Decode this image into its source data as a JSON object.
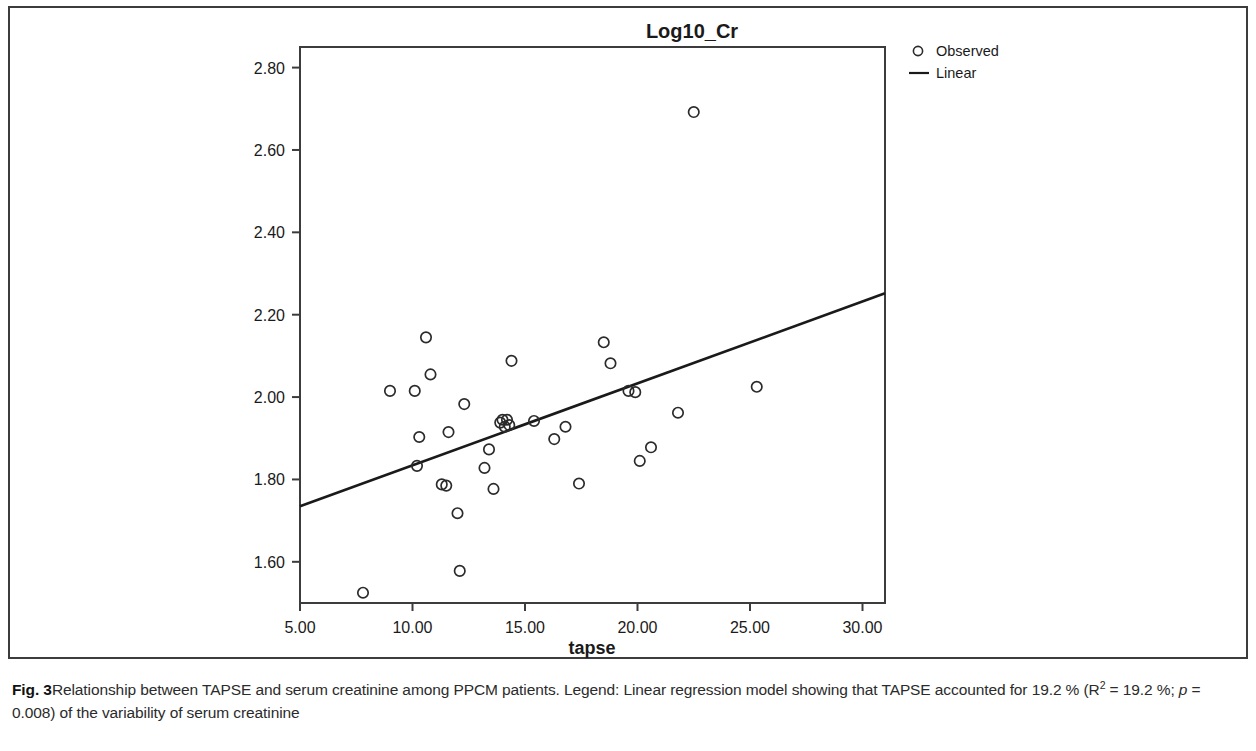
{
  "figure": {
    "title": "Log10_Cr",
    "xlabel": "tapse",
    "caption_label": "Fig. 3",
    "caption_part1": "Relationship between TAPSE and serum creatinine among PPCM patients. Legend: Linear regression model showing that TAPSE accounted for 19.2 % (R",
    "caption_sup": "2",
    "caption_part2": " = 19.2 %; ",
    "caption_p_italic": "p",
    "caption_part3": " = 0.008) of the variability of serum creatinine",
    "colors": {
      "axis": "#3c3c3c",
      "marker": "#2b2b2b",
      "line": "#1a1a1a",
      "text": "#1a1a1a",
      "background": "#ffffff"
    }
  },
  "legend": {
    "position": "top-right",
    "entries": [
      {
        "label": "Observed",
        "marker": "circle"
      },
      {
        "label": "Linear",
        "marker": "line"
      }
    ]
  },
  "chart_data": {
    "type": "scatter",
    "title": "Log10_Cr",
    "xlabel": "tapse",
    "ylabel": "Log10_Cr",
    "xlim": [
      5.0,
      31.0
    ],
    "ylim": [
      1.5,
      2.85
    ],
    "grid": false,
    "xticks": [
      "5.00",
      "10.00",
      "15.00",
      "20.00",
      "25.00",
      "30.00"
    ],
    "xtick_values": [
      5,
      10,
      15,
      20,
      25,
      30
    ],
    "yticks": [
      "1.60",
      "1.80",
      "2.00",
      "2.20",
      "2.40",
      "2.60",
      "2.80"
    ],
    "ytick_values": [
      1.6,
      1.8,
      2.0,
      2.2,
      2.4,
      2.6,
      2.8
    ],
    "series": [
      {
        "name": "Observed",
        "marker": "circle",
        "points": [
          [
            7.8,
            1.525
          ],
          [
            9.0,
            2.015
          ],
          [
            10.1,
            2.015
          ],
          [
            10.2,
            1.833
          ],
          [
            10.3,
            1.903
          ],
          [
            10.6,
            2.145
          ],
          [
            10.8,
            2.055
          ],
          [
            11.3,
            1.788
          ],
          [
            11.5,
            1.785
          ],
          [
            11.6,
            1.915
          ],
          [
            12.0,
            1.718
          ],
          [
            12.1,
            1.578
          ],
          [
            12.3,
            1.983
          ],
          [
            13.2,
            1.828
          ],
          [
            13.4,
            1.873
          ],
          [
            13.6,
            1.777
          ],
          [
            13.9,
            1.938
          ],
          [
            14.0,
            1.945
          ],
          [
            14.1,
            1.928
          ],
          [
            14.2,
            1.945
          ],
          [
            14.3,
            1.932
          ],
          [
            14.4,
            2.088
          ],
          [
            15.4,
            1.942
          ],
          [
            16.3,
            1.898
          ],
          [
            16.8,
            1.928
          ],
          [
            17.4,
            1.79
          ],
          [
            18.5,
            2.133
          ],
          [
            18.8,
            2.082
          ],
          [
            19.6,
            2.015
          ],
          [
            19.9,
            2.012
          ],
          [
            20.1,
            1.845
          ],
          [
            20.6,
            1.878
          ],
          [
            21.8,
            1.962
          ],
          [
            22.5,
            2.692
          ],
          [
            25.3,
            2.025
          ]
        ]
      }
    ],
    "fit_line": {
      "name": "Linear",
      "r_squared_percent": 19.2,
      "p_value": 0.008,
      "endpoints": [
        [
          5.0,
          1.735
        ],
        [
          31.0,
          2.252
        ]
      ]
    }
  }
}
